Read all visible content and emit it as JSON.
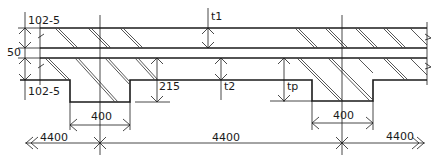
{
  "drawing": {
    "type": "section through double-slab ribbed floor",
    "dimensions": {
      "top_slab_left": "102-5",
      "gap_left": "50",
      "bottom_slab_left": "102-5",
      "t1": "t1",
      "t2": "t2",
      "tp": "tp",
      "rib_depth": "215",
      "rib_width_left": "400",
      "rib_width_right": "400",
      "span_left": "4400",
      "span_middle": "4400",
      "span_right": "4400"
    }
  }
}
